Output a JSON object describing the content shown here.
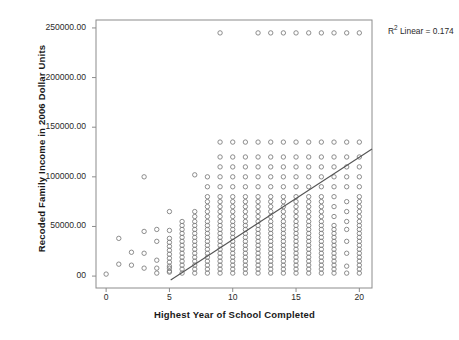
{
  "chart_data": {
    "type": "scatter",
    "title": "",
    "xlabel": "Highest Year of School Completed",
    "ylabel": "Recoded Family Income in 2006 Dollar Units",
    "xlim": [
      -0.8,
      21.0
    ],
    "ylim": [
      -12000,
      258000
    ],
    "xticks": [
      0,
      5,
      10,
      15,
      20
    ],
    "xtick_labels": [
      "0",
      "5",
      "10",
      "15",
      "20"
    ],
    "yticks": [
      0,
      50000,
      100000,
      150000,
      200000,
      250000
    ],
    "ytick_labels": [
      "00",
      "50000.00",
      "100000.00",
      "150000.00",
      "200000.00",
      "250000.00"
    ],
    "grid": false,
    "legend": "none",
    "marker": "open-circle",
    "marker_color": "#808080",
    "annotation": "R² Linear = 0.174",
    "annotation_label": "R",
    "annotation_sup": "2",
    "annotation_rest": " Linear = 0.174",
    "r_squared": 0.174,
    "fit_line": {
      "type": "linear",
      "x": [
        5.1,
        21.0
      ],
      "y": [
        -4000,
        128000
      ],
      "color": "#555555"
    },
    "columns": [
      {
        "x": 0,
        "y": [
          2000
        ]
      },
      {
        "x": 1,
        "y": [
          12000,
          38000
        ]
      },
      {
        "x": 2,
        "y": [
          11000,
          24000
        ]
      },
      {
        "x": 3,
        "y": [
          45000,
          100000,
          23000,
          8000
        ]
      },
      {
        "x": 4,
        "y": [
          35000,
          47000,
          16000,
          8000,
          3000
        ]
      },
      {
        "x": 5,
        "y": [
          5000,
          10000,
          14000,
          18000,
          22000,
          26000,
          30000,
          34000,
          38000,
          46000,
          65000,
          4000,
          8000
        ]
      },
      {
        "x": 6,
        "y": [
          3000,
          7000,
          11000,
          15000,
          19000,
          23000,
          27000,
          31000,
          35000,
          39000,
          43000,
          47000,
          51000,
          55000
        ]
      },
      {
        "x": 7,
        "y": [
          3000,
          7000,
          11000,
          15000,
          19000,
          23000,
          27000,
          31000,
          35000,
          39000,
          43000,
          47000,
          51000,
          55000,
          60000,
          65000,
          102000
        ]
      },
      {
        "x": 8,
        "y": [
          3000,
          7000,
          11000,
          15000,
          19000,
          23000,
          27000,
          31000,
          35000,
          39000,
          43000,
          47000,
          51000,
          55000,
          60000,
          65000,
          70000,
          75000,
          80000,
          90000,
          100000
        ]
      },
      {
        "x": 9,
        "y": [
          3000,
          7000,
          11000,
          15000,
          19000,
          23000,
          27000,
          31000,
          35000,
          39000,
          43000,
          47000,
          51000,
          55000,
          60000,
          65000,
          70000,
          75000,
          80000,
          90000,
          100000,
          110000,
          120000,
          135000,
          245000
        ]
      },
      {
        "x": 10,
        "y": [
          3000,
          7000,
          11000,
          15000,
          19000,
          23000,
          27000,
          31000,
          35000,
          39000,
          43000,
          47000,
          51000,
          55000,
          60000,
          65000,
          70000,
          75000,
          80000,
          90000,
          100000,
          110000,
          120000,
          135000
        ]
      },
      {
        "x": 11,
        "y": [
          3000,
          7000,
          11000,
          15000,
          19000,
          23000,
          27000,
          31000,
          35000,
          39000,
          43000,
          47000,
          51000,
          55000,
          60000,
          65000,
          70000,
          75000,
          80000,
          90000,
          100000,
          110000,
          120000,
          135000
        ]
      },
      {
        "x": 12,
        "y": [
          3000,
          7000,
          11000,
          15000,
          19000,
          23000,
          27000,
          31000,
          35000,
          39000,
          43000,
          47000,
          51000,
          55000,
          60000,
          65000,
          70000,
          75000,
          80000,
          90000,
          100000,
          110000,
          120000,
          135000,
          245000
        ]
      },
      {
        "x": 13,
        "y": [
          3000,
          7000,
          11000,
          15000,
          19000,
          23000,
          27000,
          31000,
          35000,
          39000,
          43000,
          47000,
          51000,
          55000,
          60000,
          65000,
          70000,
          75000,
          80000,
          90000,
          100000,
          110000,
          120000,
          135000,
          245000
        ]
      },
      {
        "x": 14,
        "y": [
          3000,
          7000,
          11000,
          15000,
          19000,
          23000,
          27000,
          31000,
          35000,
          39000,
          43000,
          47000,
          51000,
          55000,
          60000,
          65000,
          70000,
          75000,
          80000,
          90000,
          100000,
          110000,
          120000,
          135000,
          245000
        ]
      },
      {
        "x": 15,
        "y": [
          3000,
          7000,
          11000,
          15000,
          19000,
          23000,
          27000,
          31000,
          35000,
          39000,
          43000,
          47000,
          51000,
          55000,
          60000,
          65000,
          70000,
          75000,
          80000,
          90000,
          100000,
          110000,
          120000,
          135000,
          245000
        ]
      },
      {
        "x": 16,
        "y": [
          3000,
          7000,
          11000,
          15000,
          19000,
          23000,
          27000,
          31000,
          35000,
          39000,
          43000,
          47000,
          51000,
          55000,
          60000,
          65000,
          70000,
          75000,
          80000,
          90000,
          100000,
          110000,
          120000,
          135000,
          245000
        ]
      },
      {
        "x": 17,
        "y": [
          3000,
          7000,
          11000,
          15000,
          19000,
          23000,
          27000,
          31000,
          35000,
          39000,
          43000,
          47000,
          51000,
          55000,
          60000,
          65000,
          70000,
          75000,
          80000,
          90000,
          100000,
          110000,
          120000,
          135000,
          245000
        ]
      },
      {
        "x": 18,
        "y": [
          3000,
          7000,
          11000,
          15000,
          19000,
          23000,
          27000,
          31000,
          35000,
          39000,
          43000,
          47000,
          51000,
          60000,
          70000,
          80000,
          90000,
          100000,
          110000,
          120000,
          135000,
          245000
        ]
      },
      {
        "x": 19,
        "y": [
          3000,
          10000,
          23000,
          35000,
          47000,
          55000,
          65000,
          75000,
          90000,
          100000,
          110000,
          120000,
          135000,
          245000
        ]
      },
      {
        "x": 20,
        "y": [
          3000,
          7000,
          11000,
          15000,
          19000,
          23000,
          27000,
          31000,
          35000,
          39000,
          43000,
          47000,
          51000,
          55000,
          60000,
          65000,
          70000,
          75000,
          80000,
          90000,
          100000,
          110000,
          120000,
          135000,
          245000
        ]
      }
    ]
  },
  "plot": {
    "frame_color": "#8c8c8c",
    "background": "#ffffff"
  }
}
